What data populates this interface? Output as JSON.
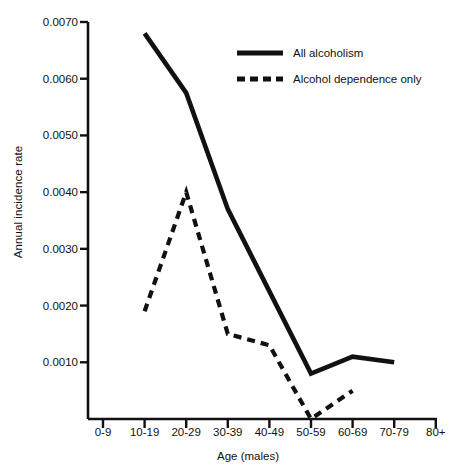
{
  "chart_data": {
    "type": "line",
    "title": "",
    "xlabel": "Age (males)",
    "ylabel": "Annual incidence rate",
    "categories": [
      "0-9",
      "10-19",
      "20-29",
      "30-39",
      "40-49",
      "50-59",
      "60-69",
      "70-79",
      "80+"
    ],
    "yticks": [
      0.001,
      0.002,
      0.003,
      0.004,
      0.005,
      0.006,
      0.007
    ],
    "ytick_labels": [
      "0.0010",
      "0.0020",
      "0.0030",
      "0.0040",
      "0.0050",
      "0.0060",
      "0.0070"
    ],
    "ylim": [
      0,
      0.007
    ],
    "grid": false,
    "legend_position": "top-right",
    "series": [
      {
        "name": "All alcoholism",
        "style": "solid",
        "color": "#111111",
        "x": [
          "10-19",
          "20-29",
          "30-39",
          "40-49",
          "50-59",
          "60-69",
          "70-79"
        ],
        "values": [
          0.0068,
          0.00575,
          0.0037,
          0.00225,
          0.0008,
          0.0011,
          0.001
        ]
      },
      {
        "name": "Alcohol dependence only",
        "style": "dashed",
        "color": "#111111",
        "x": [
          "10-19",
          "20-29",
          "30-39",
          "40-49",
          "50-59",
          "60-69"
        ],
        "values": [
          0.0019,
          0.004,
          0.0015,
          0.0013,
          0.0,
          0.0005
        ]
      }
    ]
  },
  "legend": {
    "items": [
      {
        "label": "All alcoholism",
        "style": "solid"
      },
      {
        "label": "Alcohol dependence only",
        "style": "dashed"
      }
    ]
  },
  "axes": {
    "y_title": "Annual incidence rate",
    "x_title": "Age (males)"
  }
}
